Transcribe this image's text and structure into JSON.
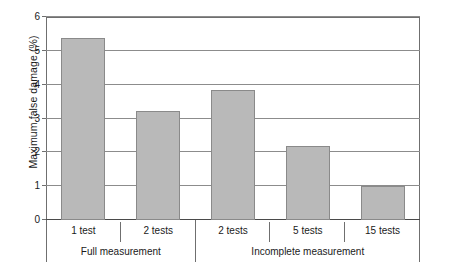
{
  "chart_data": {
    "type": "bar",
    "title": "",
    "xlabel": "",
    "ylabel": "Maximum false damage (%)",
    "categories": [
      "1 test",
      "2 tests",
      "2 tests",
      "5 tests",
      "15 tests"
    ],
    "values": [
      5.37,
      3.22,
      3.85,
      2.19,
      1.02
    ],
    "ylim": [
      0,
      6
    ],
    "yticks": [
      0,
      1,
      2,
      3,
      4,
      5,
      6
    ],
    "ytick_labels": [
      "0",
      "1",
      "2",
      "3",
      "4",
      "5",
      "6"
    ],
    "grid": true,
    "legend": false,
    "bar_color": "#b9b9b9",
    "bar_border_color": "#8a8a8a",
    "axis_color": "#6f6f6f",
    "gridline_color": "#8c8c8c",
    "groups": [
      {
        "label": "Full measurement",
        "span": 2
      },
      {
        "label": "Incomplete measurement",
        "span": 3
      }
    ]
  },
  "caption": ""
}
